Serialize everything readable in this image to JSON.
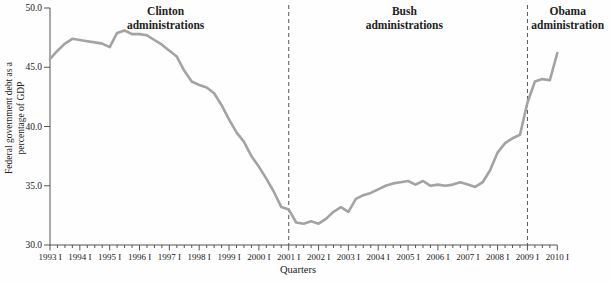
{
  "chart_data": {
    "type": "line",
    "title": "",
    "xlabel": "Quarters",
    "ylabel": "Federal government debt as a percentage of GDP",
    "ylabel_lines": [
      "Federal government debt as a",
      "percentage of GDP"
    ],
    "ylim": [
      30,
      50
    ],
    "y_ticks": [
      30,
      35,
      40,
      45,
      50
    ],
    "x_unit": "quarter",
    "x_start": "1993 Q1",
    "x_end": "2010 Q1",
    "x_tick_labels": [
      "1993 I",
      "1994 I",
      "1995 I",
      "1996 I",
      "1997 I",
      "1998 I",
      "1999 I",
      "2000 I",
      "2001 I",
      "2002 I",
      "2003 I",
      "2004 I",
      "2005 I",
      "2006 I",
      "2007 I",
      "2008 I",
      "2009 I",
      "2010 I"
    ],
    "series": [
      {
        "name": "Federal government debt as a percentage of GDP",
        "frequency": "quarterly",
        "start": "1993 Q1",
        "values": [
          45.7,
          46.4,
          47.0,
          47.4,
          47.3,
          47.2,
          47.1,
          47.0,
          46.7,
          47.9,
          48.1,
          47.8,
          47.8,
          47.7,
          47.3,
          46.9,
          46.4,
          45.9,
          44.7,
          43.8,
          43.5,
          43.3,
          42.8,
          41.8,
          40.6,
          39.5,
          38.7,
          37.5,
          36.6,
          35.6,
          34.5,
          33.2,
          33.0,
          31.9,
          31.8,
          32.0,
          31.8,
          32.2,
          32.8,
          33.2,
          32.8,
          33.9,
          34.2,
          34.4,
          34.7,
          35.0,
          35.2,
          35.3,
          35.4,
          35.1,
          35.4,
          35.0,
          35.1,
          35.0,
          35.1,
          35.3,
          35.1,
          34.9,
          35.3,
          36.3,
          37.8,
          38.6,
          39.0,
          39.3,
          42.0,
          43.8,
          44.0,
          43.9,
          46.2
        ]
      }
    ],
    "vlines": [
      {
        "label": "2001 Q1",
        "quarter_index": 32
      },
      {
        "label": "2009 Q1",
        "quarter_index": 64
      }
    ],
    "annotations": [
      {
        "lines": [
          "Clinton",
          "administrations"
        ],
        "center_quarter": 15.5
      },
      {
        "lines": [
          "Bush",
          "administrations"
        ],
        "center_quarter": 47.5
      },
      {
        "lines": [
          "Obama",
          "administration"
        ],
        "center_quarter": 69.4
      }
    ],
    "legend": false,
    "grid": false,
    "line_color": "#a3a3a3",
    "axis_color": "#555555",
    "text_color": "#222222"
  }
}
